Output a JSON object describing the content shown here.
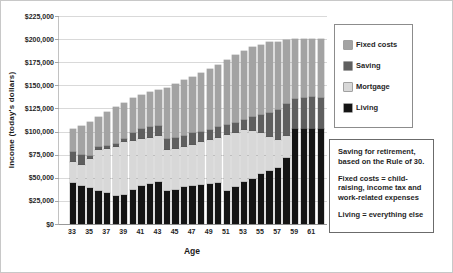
{
  "chart": {
    "y_axis_title": "Income (today's dollars)",
    "x_axis_title": "Age"
  },
  "legend": {
    "items": [
      {
        "label": "Fixed costs",
        "color": "#a3a3a3"
      },
      {
        "label": "Saving",
        "color": "#5f5f5f"
      },
      {
        "label": "Mortgage",
        "color": "#d8d8d8"
      },
      {
        "label": "Living",
        "color": "#141414"
      }
    ]
  },
  "annotation": {
    "paragraphs": [
      "Saving for retirement, based on the Rule of 30.",
      "Fixed costs = child-raising, income tax and work-related expenses",
      "Living = everything else"
    ]
  },
  "chart_data": {
    "type": "bar",
    "stacked": true,
    "title": "",
    "xlabel": "Age",
    "ylabel": "Income (today's dollars)",
    "grid": true,
    "legend_position": "right",
    "ylim": [
      0,
      225000
    ],
    "y_tick_step": 25000,
    "y_tick_labels": [
      "$225,000",
      "$200,000",
      "$175,000",
      "$150,000",
      "$125,000",
      "$100,000",
      "$75,000",
      "$50,000",
      "$25,000",
      "$0"
    ],
    "x": [
      33,
      34,
      35,
      36,
      37,
      38,
      39,
      40,
      41,
      42,
      43,
      44,
      45,
      46,
      47,
      48,
      49,
      50,
      51,
      52,
      53,
      54,
      55,
      56,
      57,
      58,
      59,
      60,
      61,
      62
    ],
    "x_tick_labels": [
      "33",
      "35",
      "37",
      "39",
      "41",
      "43",
      "45",
      "47",
      "49",
      "51",
      "53",
      "55",
      "57",
      "59",
      "61"
    ],
    "series_order_note": "series listed bottom-to-top of stack",
    "series": [
      {
        "name": "Living",
        "color": "#141414",
        "values": [
          44000,
          41500,
          38500,
          35500,
          33500,
          30500,
          31500,
          36500,
          41000,
          43000,
          45000,
          36000,
          37000,
          40000,
          41000,
          42000,
          43000,
          44000,
          36000,
          40000,
          45500,
          48500,
          54000,
          57000,
          61000,
          71500,
          102500,
          103000,
          103000,
          103000
        ]
      },
      {
        "name": "Mortgage",
        "color": "#d8d8d8",
        "values": [
          23000,
          22500,
          32000,
          45000,
          48000,
          53000,
          57000,
          53000,
          50500,
          50500,
          50000,
          44000,
          44500,
          43500,
          45000,
          46500,
          48000,
          49500,
          60000,
          58000,
          56000,
          52500,
          44000,
          37000,
          29500,
          23500,
          0,
          0,
          0,
          0
        ]
      },
      {
        "name": "Saving",
        "color": "#5f5f5f",
        "values": [
          10500,
          11000,
          3000,
          3000,
          3000,
          3000,
          3000,
          9000,
          11000,
          11000,
          11000,
          11500,
          12000,
          11500,
          12000,
          11000,
          11000,
          11000,
          11000,
          11500,
          11500,
          14500,
          20000,
          26500,
          32500,
          34500,
          33000,
          33500,
          34000,
          33500
        ]
      },
      {
        "name": "Fixed costs",
        "color": "#a3a3a3",
        "values": [
          25500,
          31000,
          37000,
          32500,
          36500,
          40000,
          39000,
          38000,
          37500,
          38000,
          39000,
          56000,
          58500,
          61000,
          61500,
          63500,
          66000,
          68000,
          71000,
          73500,
          74000,
          75500,
          76000,
          76500,
          74000,
          69500,
          64500,
          64000,
          63500,
          63500
        ]
      }
    ]
  }
}
